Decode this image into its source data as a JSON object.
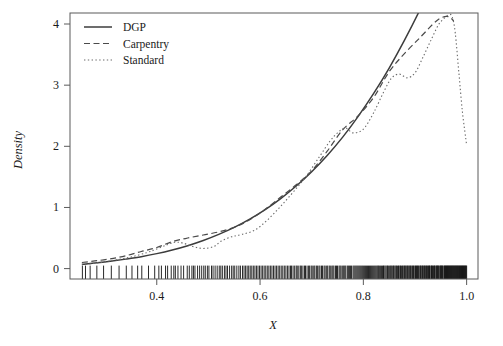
{
  "figure": {
    "background": "#ffffff",
    "plot_area": {
      "left": 70,
      "top": 13,
      "right": 478,
      "bottom": 279
    }
  },
  "chart_data": {
    "type": "line",
    "title": "",
    "xlabel": "X",
    "ylabel": "Density",
    "xlim": [
      0.232,
      1.022
    ],
    "ylim": [
      -0.17,
      4.18
    ],
    "xticks": [
      0.4,
      0.6,
      0.8,
      1.0
    ],
    "xtick_labels": [
      "0.4",
      "0.6",
      "0.8",
      "1.0"
    ],
    "yticks": [
      0,
      1,
      2,
      3,
      4
    ],
    "ytick_labels": [
      "0",
      "1",
      "2",
      "3",
      "4"
    ],
    "grid": false,
    "legend_position": "top-left",
    "legend_entries": [
      "DGP",
      "Carpentry",
      "Standard"
    ],
    "series": [
      {
        "name": "DGP",
        "style": "solid",
        "color": "#3c3c3c",
        "width": 1.5,
        "dash": "",
        "x": [
          0.255,
          0.28,
          0.31,
          0.34,
          0.37,
          0.4,
          0.43,
          0.46,
          0.49,
          0.52,
          0.55,
          0.58,
          0.61,
          0.64,
          0.67,
          0.7,
          0.73,
          0.76,
          0.79,
          0.82,
          0.85,
          0.88,
          0.91,
          0.94,
          0.97,
          1.0
        ],
        "y": [
          0.07,
          0.09,
          0.12,
          0.155,
          0.195,
          0.245,
          0.305,
          0.375,
          0.46,
          0.56,
          0.675,
          0.81,
          0.965,
          1.145,
          1.35,
          1.585,
          1.85,
          2.15,
          2.49,
          2.865,
          3.28,
          3.74,
          4.24,
          4.78,
          5.36,
          5.98
        ]
      },
      {
        "name": "Carpentry",
        "style": "dashed",
        "color": "#4a4a4a",
        "width": 1.2,
        "dash": "6,3.5",
        "x": [
          0.255,
          0.28,
          0.31,
          0.34,
          0.37,
          0.4,
          0.43,
          0.46,
          0.49,
          0.52,
          0.55,
          0.58,
          0.61,
          0.64,
          0.67,
          0.7,
          0.73,
          0.76,
          0.79,
          0.82,
          0.85,
          0.88,
          0.91,
          0.935,
          0.95,
          0.965,
          0.975
        ],
        "y": [
          0.1,
          0.125,
          0.16,
          0.21,
          0.28,
          0.345,
          0.44,
          0.5,
          0.55,
          0.6,
          0.675,
          0.8,
          0.97,
          1.17,
          1.37,
          1.6,
          1.92,
          2.27,
          2.5,
          2.8,
          3.22,
          3.52,
          3.78,
          4.0,
          4.1,
          4.12,
          4.05
        ]
      },
      {
        "name": "Standard",
        "style": "dotted",
        "color": "#6a6a6a",
        "width": 1.1,
        "dash": "1.4,2.4",
        "x": [
          0.255,
          0.29,
          0.32,
          0.35,
          0.38,
          0.4,
          0.42,
          0.435,
          0.45,
          0.47,
          0.49,
          0.51,
          0.525,
          0.545,
          0.565,
          0.59,
          0.615,
          0.64,
          0.665,
          0.69,
          0.715,
          0.735,
          0.75,
          0.765,
          0.78,
          0.8,
          0.82,
          0.84,
          0.855,
          0.87,
          0.885,
          0.9,
          0.915,
          0.93,
          0.945,
          0.955,
          0.965,
          0.972,
          0.978,
          0.985,
          0.992,
          1.0
        ],
        "y": [
          0.06,
          0.1,
          0.14,
          0.19,
          0.26,
          0.32,
          0.39,
          0.43,
          0.42,
          0.36,
          0.33,
          0.36,
          0.45,
          0.52,
          0.56,
          0.63,
          0.8,
          1.02,
          1.26,
          1.52,
          1.83,
          2.08,
          2.22,
          2.3,
          2.22,
          2.28,
          2.55,
          2.9,
          3.12,
          3.18,
          3.12,
          3.2,
          3.45,
          3.72,
          3.98,
          4.08,
          4.15,
          4.12,
          3.85,
          3.2,
          2.55,
          2.02
        ]
      }
    ],
    "rug": {
      "name": "rug-marks",
      "y_base": 0,
      "values": [
        0.256,
        0.262,
        0.271,
        0.284,
        0.297,
        0.312,
        0.327,
        0.341,
        0.352,
        0.363,
        0.371,
        0.384,
        0.396,
        0.404,
        0.409,
        0.417,
        0.421,
        0.428,
        0.433,
        0.436,
        0.441,
        0.447,
        0.452,
        0.459,
        0.463,
        0.468,
        0.471,
        0.474,
        0.479,
        0.483,
        0.487,
        0.491,
        0.494,
        0.498,
        0.501,
        0.506,
        0.509,
        0.513,
        0.517,
        0.521,
        0.524,
        0.527,
        0.531,
        0.534,
        0.537,
        0.541,
        0.545,
        0.548,
        0.551,
        0.555,
        0.559,
        0.562,
        0.566,
        0.569,
        0.572,
        0.575,
        0.578,
        0.581,
        0.584,
        0.587,
        0.59,
        0.593,
        0.596,
        0.599,
        0.602,
        0.605,
        0.608,
        0.611,
        0.614,
        0.617,
        0.62,
        0.623,
        0.626,
        0.629,
        0.632,
        0.635,
        0.638,
        0.641,
        0.644,
        0.647,
        0.65,
        0.653,
        0.656,
        0.659,
        0.661,
        0.664,
        0.667,
        0.67,
        0.672,
        0.675,
        0.678,
        0.68,
        0.683,
        0.686,
        0.688,
        0.691,
        0.694,
        0.696,
        0.699,
        0.701,
        0.704,
        0.706,
        0.709,
        0.711,
        0.714,
        0.716,
        0.719,
        0.721,
        0.724,
        0.726,
        0.729,
        0.731,
        0.734,
        0.736,
        0.739,
        0.741,
        0.743,
        0.746,
        0.748,
        0.75,
        0.753,
        0.755,
        0.757,
        0.76,
        0.762,
        0.764,
        0.766,
        0.769,
        0.771,
        0.773,
        0.775,
        0.777,
        0.78,
        0.782,
        0.784,
        0.786,
        0.788,
        0.79,
        0.792,
        0.794,
        0.796,
        0.798,
        0.8,
        0.802,
        0.804,
        0.806,
        0.808,
        0.81,
        0.812,
        0.814,
        0.816,
        0.818,
        0.82,
        0.822,
        0.824,
        0.826,
        0.828,
        0.829,
        0.831,
        0.833,
        0.835,
        0.837,
        0.839,
        0.84,
        0.842,
        0.844,
        0.846,
        0.847,
        0.849,
        0.851,
        0.853,
        0.854,
        0.856,
        0.858,
        0.859,
        0.861,
        0.863,
        0.864,
        0.866,
        0.868,
        0.869,
        0.871,
        0.872,
        0.874,
        0.876,
        0.877,
        0.879,
        0.88,
        0.882,
        0.883,
        0.885,
        0.886,
        0.888,
        0.889,
        0.891,
        0.892,
        0.894,
        0.895,
        0.897,
        0.898,
        0.9,
        0.901,
        0.903,
        0.904,
        0.905,
        0.907,
        0.908,
        0.91,
        0.911,
        0.912,
        0.914,
        0.915,
        0.916,
        0.918,
        0.919,
        0.92,
        0.922,
        0.923,
        0.924,
        0.926,
        0.927,
        0.928,
        0.929,
        0.931,
        0.932,
        0.933,
        0.934,
        0.936,
        0.937,
        0.938,
        0.939,
        0.941,
        0.942,
        0.943,
        0.944,
        0.945,
        0.946,
        0.948,
        0.949,
        0.95,
        0.951,
        0.952,
        0.953,
        0.954,
        0.956,
        0.957,
        0.958,
        0.959,
        0.96,
        0.961,
        0.962,
        0.963,
        0.964,
        0.965,
        0.966,
        0.967,
        0.968,
        0.969,
        0.97,
        0.971,
        0.972,
        0.973,
        0.974,
        0.975,
        0.976,
        0.977,
        0.978,
        0.979,
        0.98,
        0.981,
        0.982,
        0.983,
        0.984,
        0.985,
        0.986,
        0.987,
        0.988,
        0.989,
        0.99,
        0.991,
        0.992,
        0.993,
        0.994,
        0.995,
        0.996,
        0.997,
        0.998,
        0.999,
        1.0
      ]
    }
  }
}
